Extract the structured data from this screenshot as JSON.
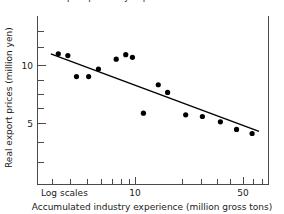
{
  "figure": {
    "top_caption_clipped": "Real export prices by experience",
    "background_color": "#ffffff",
    "axis_color": "#4a4a4a",
    "marker_color": "#000000",
    "trendline_color": "#000000"
  },
  "axes": {
    "x_title": "Accumulated industry experience (million gross tons)",
    "y_title": "Real export prices (million yen)",
    "scale_note": "Log scales",
    "x_tick_labels": [
      "10",
      "50"
    ],
    "y_tick_labels": [
      "10",
      "5"
    ]
  },
  "chart_data": {
    "type": "scatter",
    "title": "Real export prices by experience",
    "xlabel": "Accumulated industry experience (million gross tons)",
    "ylabel": "Real export prices (million yen)",
    "xscale": "log",
    "yscale": "log",
    "xlim": [
      5.2,
      62
    ],
    "ylim": [
      2.6,
      16
    ],
    "grid": false,
    "legend": false,
    "annotations": [
      "Log scales"
    ],
    "x_ticks": [
      10,
      50
    ],
    "y_ticks": [
      10,
      5
    ],
    "points": [
      {
        "x": 6.5,
        "y": 10.6
      },
      {
        "x": 7.2,
        "y": 10.4
      },
      {
        "x": 7.9,
        "y": 8.3
      },
      {
        "x": 9.0,
        "y": 8.3
      },
      {
        "x": 10.0,
        "y": 9.0
      },
      {
        "x": 12.1,
        "y": 10.0
      },
      {
        "x": 13.4,
        "y": 10.5
      },
      {
        "x": 14.4,
        "y": 10.2
      },
      {
        "x": 16.2,
        "y": 5.6
      },
      {
        "x": 19.0,
        "y": 7.6
      },
      {
        "x": 21.0,
        "y": 7.0
      },
      {
        "x": 25.5,
        "y": 5.5
      },
      {
        "x": 30.5,
        "y": 5.4
      },
      {
        "x": 37.0,
        "y": 5.1
      },
      {
        "x": 44.0,
        "y": 4.7
      },
      {
        "x": 52.0,
        "y": 4.5
      }
    ],
    "trendline": {
      "label": "fitted experience curve",
      "x_start": 6.0,
      "y_start": 10.6,
      "x_end": 56.0,
      "y_end": 4.6
    }
  }
}
